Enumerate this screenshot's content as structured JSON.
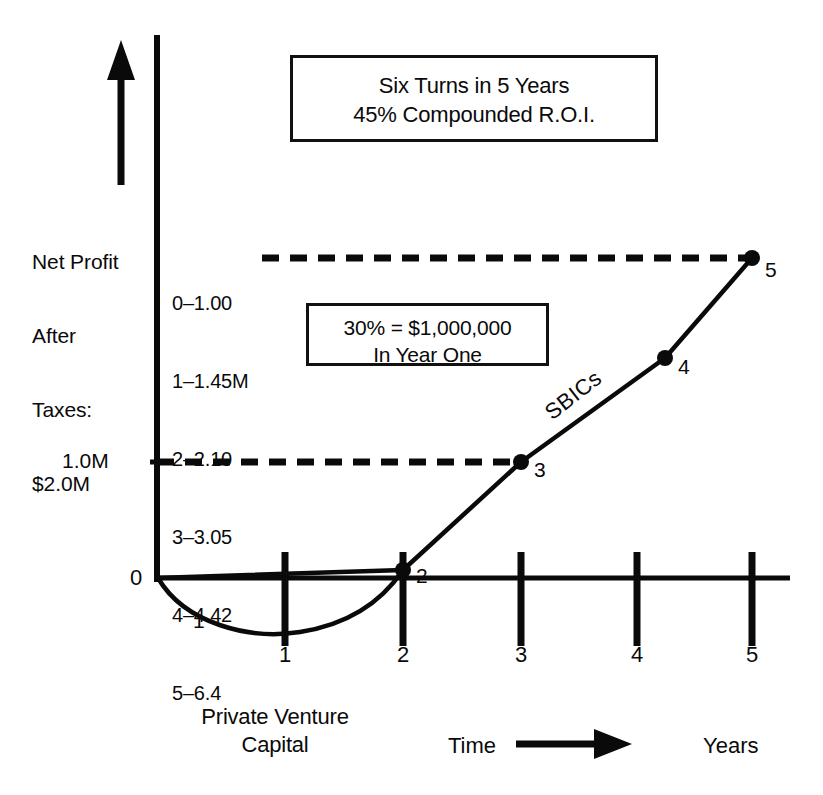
{
  "headline_box": {
    "line1": "Six Turns in 5 Years",
    "line2": "45% Compounded R.O.I."
  },
  "note_box": {
    "line1": "30% = $1,000,000",
    "line2": "In Year One"
  },
  "y_axis_caption": {
    "line1": "Net Profit",
    "line2": "After",
    "line3": "Taxes:",
    "line4": "$2.0M"
  },
  "value_legend": [
    "0–1.00",
    "1–1.45M",
    "2–2.10",
    "3–3.05",
    "4–4.42",
    "5–6.4"
  ],
  "axis": {
    "y_label_1m": "1.0M",
    "y_label_zero": "0",
    "x_tick_labels": [
      "1",
      "2",
      "3",
      "4",
      "5"
    ],
    "x_caption_left": "Private Venture\nCapital",
    "x_caption_center": "Time",
    "x_caption_right": "Years"
  },
  "series_labels": {
    "sbics": "SBICs",
    "jcurve": "1"
  },
  "point_labels": [
    "2",
    "3",
    "4",
    "5"
  ],
  "colors": {
    "ink": "#0a0a0a",
    "background": "#ffffff"
  },
  "chart_data": {
    "type": "line",
    "xlabel": "Time (Years)",
    "ylabel": "Net Profit After Taxes: $2.0M",
    "xlim": [
      0,
      5
    ],
    "ylim": [
      -0.25,
      2.0
    ],
    "grid": false,
    "legend_position": "inline-annotation",
    "x": [
      0,
      1,
      2,
      3,
      4,
      5
    ],
    "x_tick_labels": [
      "1",
      "2",
      "3",
      "4",
      "5"
    ],
    "y_tick_labels": [
      "0",
      "1.0M"
    ],
    "series": [
      {
        "name": "SBICs",
        "values": [
          0,
          0.28,
          0.53,
          1.0,
          1.48,
          1.92
        ],
        "marked_points": [
          {
            "label": "2",
            "x": 2,
            "y": 0.53
          },
          {
            "label": "3",
            "x": 3,
            "y": 1.0
          },
          {
            "label": "4",
            "x": 4,
            "y": 1.48
          },
          {
            "label": "5",
            "x": 5,
            "y": 1.92
          }
        ]
      },
      {
        "name": "Private Venture Capital (J-curve)",
        "values": [
          0,
          -0.12,
          0.0
        ],
        "x": [
          0,
          1,
          1.75
        ],
        "label": "1"
      }
    ],
    "reference_lines": [
      {
        "label": "1.0M",
        "y": 1.0,
        "style": "dashed",
        "from_x": 0,
        "to_x": 3
      },
      {
        "label": "0–1.00",
        "y": 1.92,
        "style": "dashed",
        "from_x": 0.55,
        "to_x": 5
      }
    ],
    "value_table": {
      "columns": [
        "Year",
        "Value"
      ],
      "rows": [
        [
          "0",
          "1.00"
        ],
        [
          "1",
          "1.45M"
        ],
        [
          "2",
          "2.10"
        ],
        [
          "3",
          "3.05"
        ],
        [
          "4",
          "4.42"
        ],
        [
          "5",
          "6.4"
        ]
      ]
    },
    "annotations": [
      "Six Turns in 5 Years",
      "45% Compounded R.O.I.",
      "30% = $1,000,000",
      "In Year One"
    ]
  }
}
